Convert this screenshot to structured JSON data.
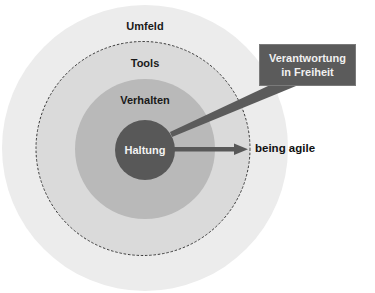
{
  "diagram": {
    "type": "concentric-circles",
    "rings": [
      {
        "id": "umfeld",
        "label": "Umfeld",
        "color": "#ececec"
      },
      {
        "id": "tools",
        "label": "Tools",
        "color": "#dadada",
        "border": "dashed"
      },
      {
        "id": "verhalten",
        "label": "Verhalten",
        "color": "#b9b9b9"
      },
      {
        "id": "haltung",
        "label": "Haltung",
        "color": "#585858"
      }
    ],
    "callout": {
      "line1": "Verantwortung",
      "line2": "in Freiheit",
      "color": "#5b5b5b"
    },
    "arrow": {
      "label": "being agile",
      "color": "#585858"
    }
  }
}
